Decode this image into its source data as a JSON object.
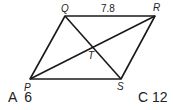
{
  "diagram": {
    "type": "parallelogram",
    "vertices": {
      "P": {
        "label": "P",
        "x": 30,
        "y": 79
      },
      "Q": {
        "label": "Q",
        "x": 65,
        "y": 16
      },
      "R": {
        "label": "R",
        "x": 155,
        "y": 16
      },
      "S": {
        "label": "S",
        "x": 121,
        "y": 79
      },
      "T": {
        "label": "T",
        "x": 93,
        "y": 48
      }
    },
    "segment_labels": {
      "QR": "7.8"
    },
    "edges": [
      "PQ",
      "QR",
      "RS",
      "SP"
    ],
    "diagonals": [
      "PR",
      "QS"
    ],
    "stroke_color": "#1a1a1a"
  },
  "choices": [
    {
      "letter": "A",
      "value": "6",
      "text": "A  6"
    },
    {
      "letter": "C",
      "value": "12",
      "text": "C 12"
    }
  ]
}
